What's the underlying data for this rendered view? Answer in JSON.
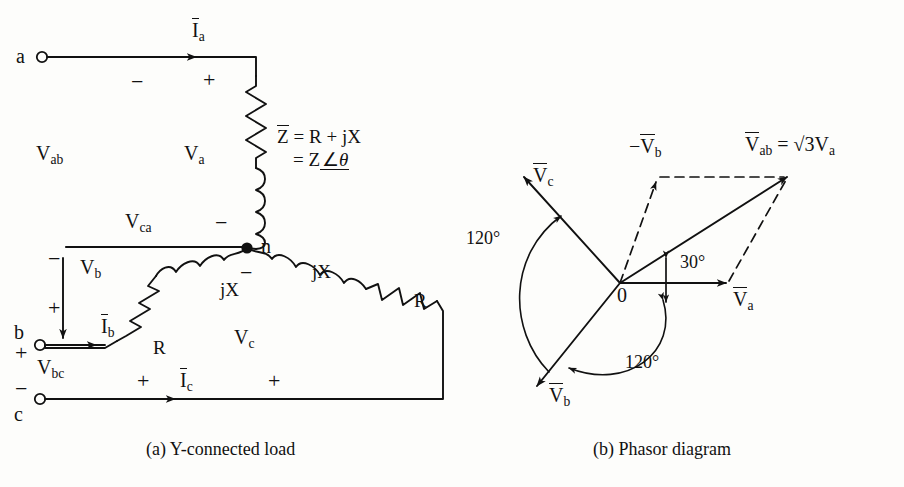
{
  "figure": {
    "captions": {
      "a": "(a) Y-connected load",
      "b": "(b) Phasor diagram"
    }
  },
  "circuit": {
    "terminals": [
      {
        "name": "a",
        "label": "a"
      },
      {
        "name": "b",
        "label": "b"
      },
      {
        "name": "c",
        "label": "c"
      }
    ],
    "neutral_label": "n",
    "currents": [
      {
        "name": "Ia",
        "base": "I",
        "sub": "a"
      },
      {
        "name": "Ib",
        "base": "I",
        "sub": "b"
      },
      {
        "name": "Ic",
        "base": "I",
        "sub": "c"
      }
    ],
    "line_voltages": [
      {
        "name": "Vab",
        "base": "V",
        "sub": "ab"
      },
      {
        "name": "Vbc",
        "base": "V",
        "sub": "bc"
      },
      {
        "name": "Vca",
        "base": "V",
        "sub": "ca"
      }
    ],
    "phase_voltages": [
      {
        "name": "Va",
        "base": "V",
        "sub": "a"
      },
      {
        "name": "Vb",
        "base": "V",
        "sub": "b"
      },
      {
        "name": "Vc",
        "base": "V",
        "sub": "c"
      }
    ],
    "components": {
      "resistor_label": "R",
      "reactance_label": "jX"
    },
    "impedance": {
      "line1_lhs": "Z",
      "line1_rhs": "= R + jX",
      "line2": "= Z",
      "angle_symbol": "∠",
      "theta": "θ"
    },
    "polarity": {
      "plus": "+",
      "minus": "−"
    }
  },
  "phasor": {
    "origin_label": "0",
    "vectors": [
      {
        "name": "Va",
        "base": "V",
        "sub": "a",
        "angle_deg": 0,
        "style": "solid",
        "magnitude": 1.0
      },
      {
        "name": "Vb",
        "base": "V",
        "sub": "b",
        "angle_deg": -120,
        "style": "solid",
        "magnitude": 1.0
      },
      {
        "name": "Vc",
        "base": "V",
        "sub": "c",
        "angle_deg": 120,
        "style": "solid",
        "magnitude": 1.0
      },
      {
        "name": "-Vb",
        "prefix": "−",
        "base": "V",
        "sub": "b",
        "angle_deg": 60,
        "style": "dashed",
        "magnitude": 1.0
      },
      {
        "name": "Vab",
        "base": "V",
        "sub": "ab",
        "angle_deg": 30,
        "style": "solid",
        "magnitude": 1.732
      }
    ],
    "resultant": {
      "base": "V",
      "sub": "ab",
      "equals": "= √3V",
      "equals_sub": "a"
    },
    "angles": [
      {
        "name": "angle-30",
        "label": "30°",
        "value": 30
      },
      {
        "name": "angle-120-upper",
        "label": "120°",
        "value": 120
      },
      {
        "name": "angle-120-lower",
        "label": "120°",
        "value": 120
      }
    ]
  },
  "colors": {
    "ink": "#111111",
    "paper": "#fdfdfb"
  }
}
